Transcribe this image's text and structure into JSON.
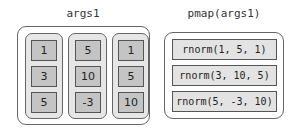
{
  "left": {
    "title": "args1",
    "columns": [
      {
        "values": [
          "1",
          "3",
          "5"
        ]
      },
      {
        "values": [
          "5",
          "10",
          "-3"
        ]
      },
      {
        "values": [
          "1",
          "5",
          "10"
        ]
      }
    ]
  },
  "right": {
    "title": "pmap(args1)",
    "rows": [
      {
        "label": "rnorm(1, 5, 1)"
      },
      {
        "label": "rnorm(3, 10, 5)"
      },
      {
        "label": "rnorm(5, -3, 10)"
      }
    ]
  }
}
